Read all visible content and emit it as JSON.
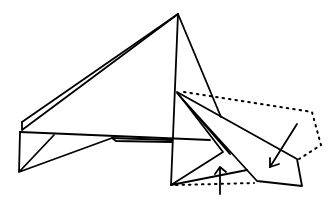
{
  "diagram": {
    "title": "",
    "stroke_color": "#000000",
    "background": "#ffffff",
    "arrows": [
      {
        "name": "fold-arrow-down-left"
      },
      {
        "name": "fold-arrow-up"
      }
    ]
  }
}
